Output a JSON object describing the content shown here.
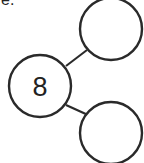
{
  "problem_label": "e.",
  "number_bond": {
    "whole": "8",
    "parts": [
      "",
      ""
    ]
  },
  "colors": {
    "stroke": "#2a2a2a",
    "background": "#ffffff"
  }
}
